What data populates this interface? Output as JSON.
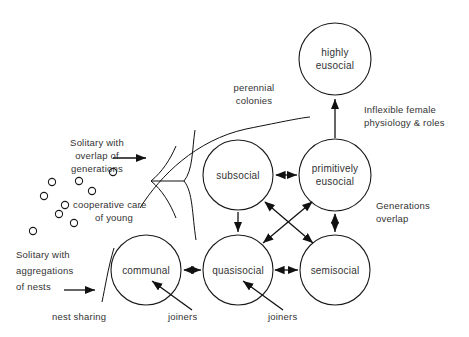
{
  "figure": {
    "background_color": "#ffffff",
    "line_color": "#111111",
    "text_color": "#333333"
  },
  "nodes": [
    {
      "id": "highly-eusocial",
      "label_line1": "highly",
      "label_line2": "eusocial",
      "cx": 335,
      "cy": 59,
      "r": 36
    },
    {
      "id": "subsocial",
      "label_line1": "subsocial",
      "label_line2": "",
      "cx": 238,
      "cy": 175,
      "r": 35
    },
    {
      "id": "primitively-eusocial",
      "label_line1": "primitively",
      "label_line2": "eusocial",
      "cx": 335,
      "cy": 175,
      "r": 36
    },
    {
      "id": "communal",
      "label_line1": "communal",
      "label_line2": "",
      "cx": 146,
      "cy": 270,
      "r": 35
    },
    {
      "id": "quasisocial",
      "label_line1": "quasisocial",
      "label_line2": "",
      "cx": 238,
      "cy": 270,
      "r": 35
    },
    {
      "id": "semisocial",
      "label_line1": "semisocial",
      "label_line2": "",
      "cx": 335,
      "cy": 270,
      "r": 35
    }
  ],
  "annotations": {
    "perennial_colonies_line1": "perennial",
    "perennial_colonies_line2": "colonies",
    "inflexible_line1": "Inflexible  female",
    "inflexible_line2": "physiology  &  roles",
    "generations_overlap_line1": "Generations",
    "generations_overlap_line2": "overlap",
    "solitary_overlap_line1": "Solitary   with",
    "solitary_overlap_line2": "overlap  of",
    "solitary_overlap_line3": "generations",
    "cooperative_care_line1": "cooperative  care",
    "cooperative_care_line2": "of young",
    "solitary_aggregations_line1": "Solitary  with",
    "solitary_aggregations_line2": "aggregations",
    "solitary_aggregations_line3": "of  nests",
    "nest_sharing": "nest  sharing",
    "joiners_left": "joiners",
    "joiners_right": "joiners"
  },
  "solitary_individuals": [
    {
      "cx": 52,
      "cy": 182,
      "r": 3.6
    },
    {
      "cx": 79,
      "cy": 181,
      "r": 3.6
    },
    {
      "cx": 92,
      "cy": 191,
      "r": 3.6
    },
    {
      "cx": 44,
      "cy": 196,
      "r": 3.6
    },
    {
      "cx": 65,
      "cy": 205,
      "r": 3.6
    },
    {
      "cx": 59,
      "cy": 214,
      "r": 3.6
    },
    {
      "cx": 74,
      "cy": 223,
      "r": 3.6
    },
    {
      "cx": 33,
      "cy": 231,
      "r": 3.6
    },
    {
      "cx": 113,
      "cy": 172,
      "r": 3.6
    }
  ],
  "connections": [
    {
      "id": "subsocial-to-primitively",
      "type": "double-arrow"
    },
    {
      "id": "primitively-to-highly",
      "type": "single-arrow-up"
    },
    {
      "id": "subsocial-to-quasisocial",
      "type": "single-arrow-down"
    },
    {
      "id": "primitively-to-semisocial",
      "type": "double-arrow-vertical"
    },
    {
      "id": "communal-to-quasisocial",
      "type": "double-arrow"
    },
    {
      "id": "quasisocial-to-semisocial",
      "type": "double-arrow"
    },
    {
      "id": "subsocial-to-semisocial",
      "type": "double-arrow-diagonal"
    },
    {
      "id": "quasisocial-to-primitively",
      "type": "double-arrow-diagonal"
    }
  ]
}
